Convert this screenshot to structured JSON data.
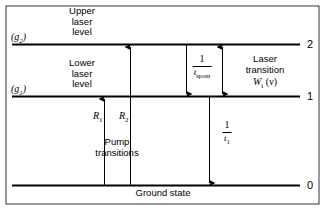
{
  "figure": {
    "type": "energy-level-diagram",
    "colors": {
      "line": "#000000",
      "background": "#ffffff"
    }
  },
  "levels": [
    {
      "id": "level-2",
      "number": "2",
      "degeneracy": "g",
      "degeneracy_sub": "2",
      "name": "Upper laser level",
      "name_lines": [
        "Upper",
        "laser",
        "level"
      ]
    },
    {
      "id": "level-1",
      "number": "1",
      "degeneracy": "g",
      "degeneracy_sub": "1",
      "name": "Lower laser level",
      "name_lines": [
        "Lower",
        "laser",
        "level"
      ]
    },
    {
      "id": "level-0",
      "number": "0",
      "degeneracy": "",
      "degeneracy_sub": "",
      "name": "Ground state",
      "name_lines": [
        "Ground  state"
      ]
    }
  ],
  "transitions": [
    {
      "id": "pump-1",
      "label": "R",
      "label_sub": "1",
      "direction": "up",
      "from": "0",
      "to": "1"
    },
    {
      "id": "pump-2",
      "label": "R",
      "label_sub": "2",
      "direction": "up",
      "from": "0",
      "to": "2"
    },
    {
      "id": "spontaneous",
      "numerator": "1",
      "denominator": "t",
      "denominator_sub": "spont",
      "direction": "down",
      "from": "2",
      "to": "1"
    },
    {
      "id": "laser",
      "direction": "both",
      "from": "2",
      "to": "1",
      "lines": [
        "Laser",
        "transition"
      ],
      "symbol": "W",
      "symbol_sub": "i",
      "symbol_arg": "(ν)"
    },
    {
      "id": "lower-decay",
      "numerator": "1",
      "denominator": "t",
      "denominator_sub": "1",
      "direction": "down",
      "from": "1",
      "to": "0"
    }
  ],
  "annotations": {
    "pump_label_lines": [
      "Pump",
      "transitions"
    ],
    "ground_state_label": "Ground  state"
  }
}
